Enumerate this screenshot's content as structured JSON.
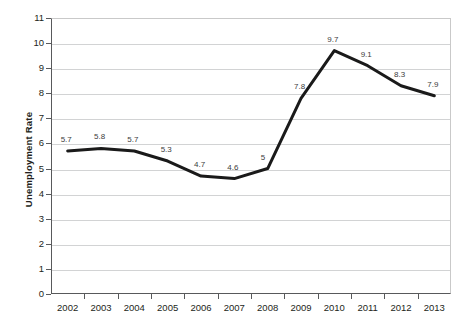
{
  "chart_data": {
    "type": "line",
    "title": "",
    "xlabel": "",
    "ylabel": "Unemployment Rate",
    "categories": [
      "2002",
      "2003",
      "2004",
      "2005",
      "2006",
      "2007",
      "2008",
      "2009",
      "2010",
      "2011",
      "2012",
      "2013"
    ],
    "values": [
      5.7,
      5.8,
      5.7,
      5.3,
      4.7,
      4.6,
      5,
      7.8,
      9.7,
      9.1,
      8.3,
      7.9
    ],
    "point_labels": [
      "5.7",
      "5.8",
      "5.7",
      "5.3",
      "4.7",
      "4.6",
      "5",
      "7.8",
      "9.7",
      "9.1",
      "8.3",
      "7.9"
    ],
    "ylim": [
      0,
      11
    ],
    "yticks": [
      0,
      1,
      2,
      3,
      4,
      5,
      6,
      7,
      8,
      9,
      10,
      11
    ],
    "ytick_labels": [
      "0",
      "1",
      "2",
      "3",
      "4",
      "5",
      "6",
      "7",
      "8",
      "9",
      "10",
      "11"
    ],
    "grid": true,
    "legend": false,
    "series_color": "#1a1a1a",
    "gridline_color": "#d2d3d4",
    "axis_color": "#58595b",
    "background_color": "#ffffff"
  }
}
